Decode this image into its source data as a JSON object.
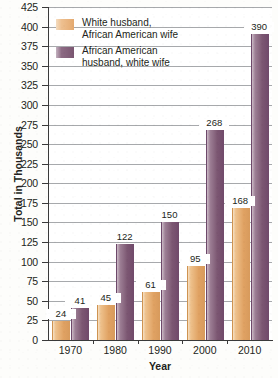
{
  "chart_data": {
    "type": "bar",
    "title": "",
    "xlabel": "Year",
    "ylabel": "Total in Thousands",
    "categories": [
      "1970",
      "1980",
      "1990",
      "2000",
      "2010"
    ],
    "series": [
      {
        "name": "White husband,\nAfrican American wife",
        "color": "#e0a263",
        "values": [
          24,
          45,
          61,
          95,
          168
        ]
      },
      {
        "name": "African American\nhusband, white wife",
        "color": "#7c5772",
        "values": [
          41,
          122,
          150,
          268,
          390
        ]
      }
    ],
    "ylim": [
      0,
      425
    ],
    "ytick_step": 25,
    "yticks": [
      "0",
      "25",
      "50",
      "75",
      "100",
      "125",
      "150",
      "175",
      "200",
      "225",
      "250",
      "275",
      "300",
      "325",
      "350",
      "375",
      "400",
      "425"
    ],
    "grid": true,
    "legend_position": "top-left-inside"
  },
  "legend": {
    "entries": [
      {
        "label": "White husband,\nAfrican American wife",
        "swatch": "tan"
      },
      {
        "label": "African American\nhusband, white wife",
        "swatch": "purple"
      }
    ]
  },
  "axes": {
    "x_title": "Year",
    "y_title": "Total in Thousands"
  }
}
